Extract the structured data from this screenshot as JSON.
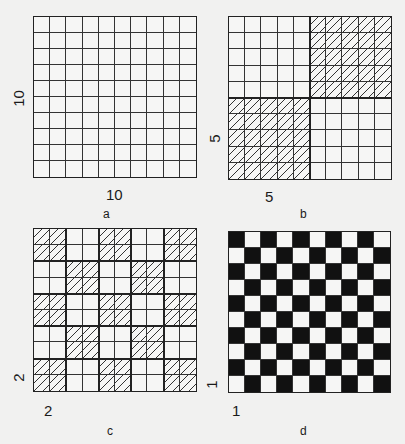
{
  "panels": [
    {
      "id": "a",
      "caption": "a",
      "x_label": "10",
      "y_label": "10",
      "pattern": "plain",
      "block": 10
    },
    {
      "id": "b",
      "caption": "b",
      "x_label": "5",
      "y_label": "5",
      "pattern": "checker-hatch",
      "block": 5,
      "hatched_first": false
    },
    {
      "id": "c",
      "caption": "c",
      "x_label": "2",
      "y_label": "2",
      "pattern": "checker-hatch",
      "block": 2,
      "hatched_first": true
    },
    {
      "id": "d",
      "caption": "d",
      "x_label": "1",
      "y_label": "1",
      "pattern": "checker-black",
      "block": 1,
      "hatched_first": true
    }
  ],
  "grid": {
    "rows": 10,
    "cols": 10
  },
  "colors": {
    "background": "#f1f1f0",
    "line": "#222222",
    "fill": "#111111"
  }
}
